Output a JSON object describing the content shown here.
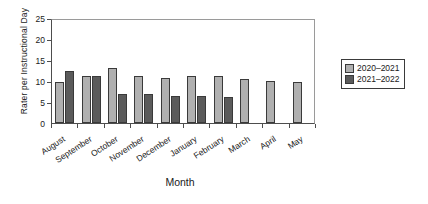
{
  "chart_data": {
    "type": "bar",
    "title": "",
    "xlabel": "Month",
    "ylabel": "Rater per Instructional Day",
    "categories": [
      "August",
      "September",
      "October",
      "November",
      "December",
      "January",
      "February",
      "March",
      "April",
      "May"
    ],
    "series": [
      {
        "name": "2020–2021",
        "color": "#b0b0b0",
        "values": [
          9.8,
          11.1,
          13.1,
          11.3,
          10.8,
          11.2,
          11.2,
          10.4,
          10.0,
          9.8
        ]
      },
      {
        "name": "2021–2022",
        "color": "#5b5b5b",
        "values": [
          12.4,
          11.3,
          6.9,
          6.9,
          6.5,
          6.4,
          6.3,
          null,
          null,
          null
        ]
      }
    ],
    "ylim": [
      0,
      25
    ],
    "yticks": [
      0,
      5,
      10,
      15,
      20,
      25
    ],
    "ytick_labels": [
      "0",
      "5",
      "10",
      "15",
      "20",
      "25"
    ],
    "grid": false,
    "legend_position": "right"
  },
  "legend": {
    "entries": [
      {
        "label": "2020–2021",
        "color": "#b0b0b0"
      },
      {
        "label": "2021–2022",
        "color": "#5b5b5b"
      }
    ]
  }
}
